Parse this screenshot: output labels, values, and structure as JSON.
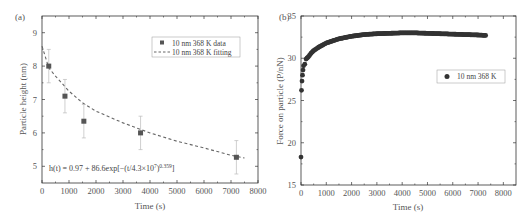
{
  "chart_data": [
    {
      "panel": "(a)",
      "type": "scatter",
      "title": "",
      "xlabel": "Time (s)",
      "ylabel": "Particle height (nm)",
      "xlim": [
        0,
        8000
      ],
      "ylim": [
        4.5,
        9.5
      ],
      "xticks": [
        0,
        1000,
        2000,
        3000,
        4000,
        5000,
        6000,
        7000,
        8000
      ],
      "yticks": [
        5,
        6,
        7,
        8,
        9
      ],
      "grid": false,
      "legend_position": "upper right",
      "series": [
        {
          "name": "10 nm 368 K data",
          "marker": "square",
          "x": [
            250,
            850,
            1550,
            3650,
            7200
          ],
          "y": [
            8.0,
            7.1,
            6.35,
            6.0,
            5.27
          ],
          "yerr": [
            0.5,
            0.5,
            0.5,
            0.5,
            0.5
          ]
        },
        {
          "name": "10 nm 368 K fitting",
          "line": "dashed",
          "x": [
            0,
            250,
            500,
            1000,
            1500,
            2000,
            3000,
            4000,
            5000,
            6000,
            7000,
            7500
          ],
          "y": [
            8.6,
            7.95,
            7.7,
            7.25,
            6.9,
            6.65,
            6.3,
            6.0,
            5.75,
            5.55,
            5.33,
            5.25
          ]
        }
      ],
      "annotations": [
        "h(t) = 0.97 + 86.6exp[−(t/4.3×10⁷)^0.359]"
      ]
    },
    {
      "panel": "(b)",
      "type": "scatter",
      "title": "",
      "xlabel": "Time (s)",
      "ylabel": "Force on particle (P/nN)",
      "xlim": [
        0,
        8500
      ],
      "ylim": [
        15,
        35
      ],
      "xticks": [
        0,
        1000,
        2000,
        3000,
        4000,
        5000,
        6000,
        7000,
        8000
      ],
      "yticks": [
        15,
        20,
        25,
        30,
        35
      ],
      "grid": false,
      "legend_position": "center right",
      "series": [
        {
          "name": "10 nm 368 K",
          "marker": "circle",
          "x": [
            0,
            20,
            40,
            60,
            80,
            100,
            150,
            200,
            300,
            400,
            500,
            700,
            1000,
            1500,
            2000,
            2500,
            3000,
            3500,
            4000,
            4500,
            5000,
            5500,
            6000,
            6500,
            7000,
            7300
          ],
          "y": [
            18.3,
            26.2,
            27.3,
            28.0,
            28.6,
            29.1,
            29.3,
            29.9,
            30.2,
            30.6,
            30.9,
            31.3,
            31.8,
            32.3,
            32.6,
            32.8,
            32.9,
            32.95,
            33.0,
            33.0,
            32.95,
            32.9,
            32.85,
            32.8,
            32.75,
            32.7
          ]
        }
      ]
    }
  ],
  "panels": {
    "a": {
      "label": "(a)",
      "xlabel": "Time (s)",
      "ylabel": "Particle height (nm)",
      "legend": [
        "10 nm 368 K data",
        "10 nm 368 K fitting"
      ],
      "equation": "h(t) = 0.97 + 86.6exp[−(t/4.3×10",
      "equation_sup1": "7",
      "equation_mid": ")",
      "equation_sup2": "0.359",
      "equation_end": "]"
    },
    "b": {
      "label": "(b)",
      "xlabel": "Time (s)",
      "ylabel": "Force on particle (P/nN)",
      "legend": [
        "10 nm 368 K"
      ]
    },
    "colors": {
      "marker": "#555555",
      "axis": "#333333",
      "fit_line": "#666666",
      "errorbar": "#aaaaaa"
    }
  }
}
